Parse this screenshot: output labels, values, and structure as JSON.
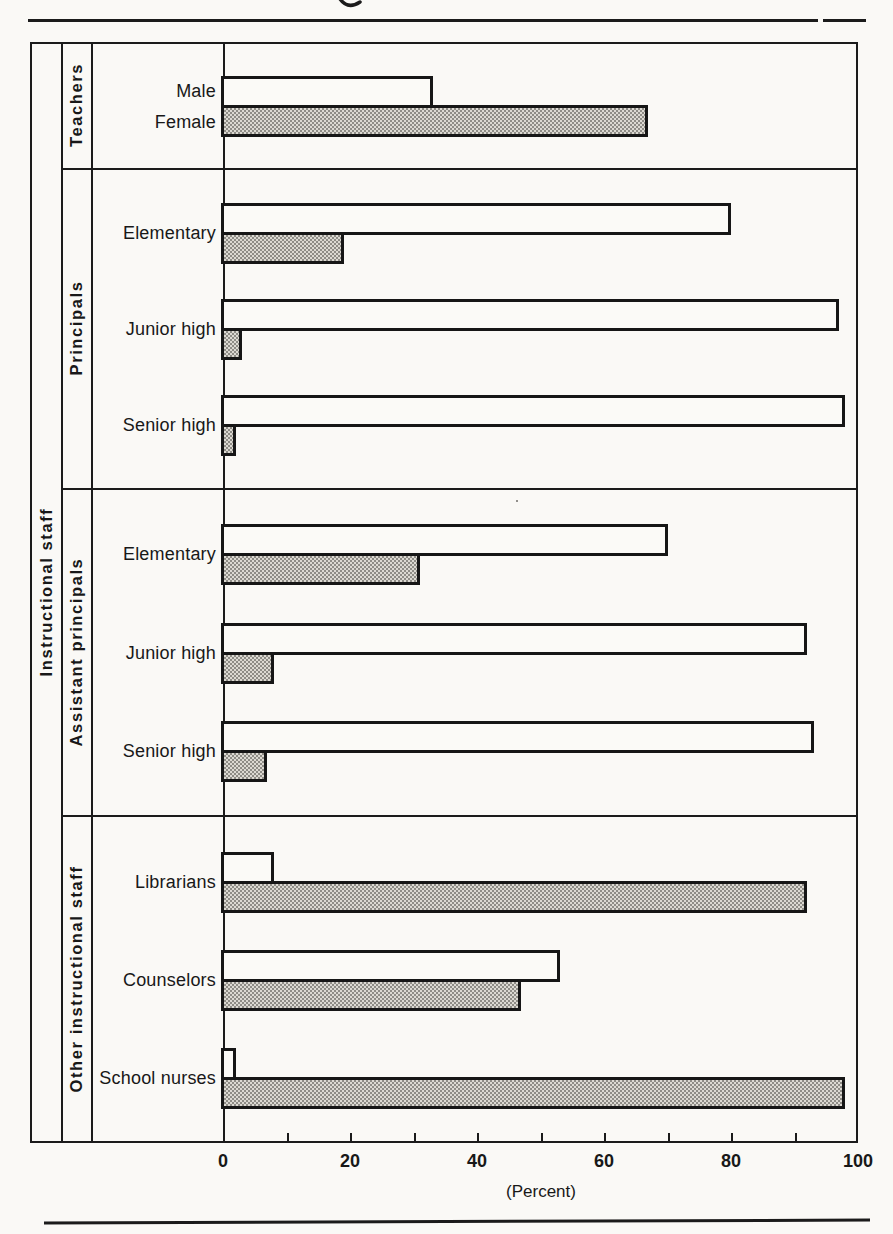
{
  "chart_data": {
    "type": "bar",
    "orientation": "horizontal",
    "title": "",
    "xlabel": "(Percent)",
    "xlim": [
      0,
      100
    ],
    "x_major_ticks": [
      0,
      20,
      40,
      60,
      80,
      100
    ],
    "x_minor_tick_step": 10,
    "grid": false,
    "legend_position": "none",
    "outer_label": "Instructional staff",
    "bar_styles": {
      "white_outlined": "Male",
      "shaded_stippled": "Female"
    },
    "groups": [
      {
        "label": "Teachers",
        "rows": [
          {
            "label": "",
            "bar_labels": {
              "white": "Male",
              "shaded": "Female"
            },
            "white_pct": 33,
            "shaded_pct": 67
          }
        ]
      },
      {
        "label": "Principals",
        "rows": [
          {
            "label": "Elementary",
            "white_pct": 80,
            "shaded_pct": 19
          },
          {
            "label": "Junior high",
            "white_pct": 97,
            "shaded_pct": 3
          },
          {
            "label": "Senior high",
            "white_pct": 98,
            "shaded_pct": 2
          }
        ]
      },
      {
        "label": "Assistant principals",
        "rows": [
          {
            "label": "Elementary",
            "white_pct": 70,
            "shaded_pct": 31
          },
          {
            "label": "Junior high",
            "white_pct": 92,
            "shaded_pct": 8
          },
          {
            "label": "Senior high",
            "white_pct": 93,
            "shaded_pct": 7
          }
        ]
      },
      {
        "label": "Other instructional staff",
        "rows": [
          {
            "label": "Librarians",
            "white_pct": 8,
            "shaded_pct": 92
          },
          {
            "label": "Counselors",
            "white_pct": 53,
            "shaded_pct": 47
          },
          {
            "label": "School nurses",
            "white_pct": 2,
            "shaded_pct": 98
          }
        ]
      }
    ],
    "colors": {
      "line": "#1b1b1b",
      "paper": "#faf9f6",
      "shaded_fill": "#dcd9d2",
      "shaded_dot": "#8e8c86"
    }
  }
}
